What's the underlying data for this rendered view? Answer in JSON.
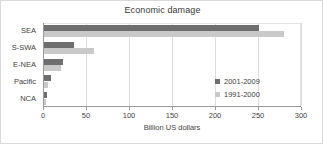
{
  "chart_data": {
    "type": "bar",
    "orientation": "horizontal",
    "title": "Economic damage",
    "xlabel": "Billion US dollars",
    "ylabel": "",
    "xlim": [
      0,
      300
    ],
    "xticks": [
      0,
      50,
      100,
      150,
      200,
      250,
      300
    ],
    "grid": true,
    "legend_position": "center-right",
    "categories": [
      "SEA",
      "S-SWA",
      "E-NEA",
      "Pacific",
      "NCA"
    ],
    "series": [
      {
        "name": "2001-2009",
        "color": "#6e6e6e",
        "values": [
          250,
          35,
          22,
          8,
          3
        ]
      },
      {
        "name": "1991-2000",
        "color": "#c9c9c9",
        "values": [
          279,
          58,
          20,
          5,
          2
        ]
      }
    ]
  }
}
